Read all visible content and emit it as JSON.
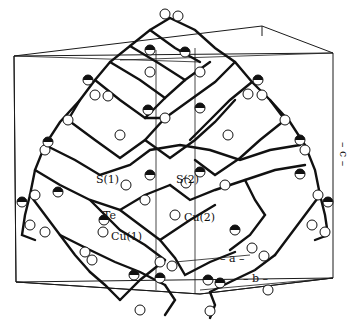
{
  "figure": {
    "atom_labels": [
      {
        "id": "s1",
        "text": "S(1)",
        "x": 96,
        "y": 167
      },
      {
        "id": "s2",
        "text": "S(2)",
        "x": 177,
        "y": 167
      },
      {
        "id": "te",
        "text": "Te",
        "x": 104,
        "y": 208
      },
      {
        "id": "cu1",
        "text": "Cu(1)",
        "x": 112,
        "y": 228
      },
      {
        "id": "cu2",
        "text": "Cu(2)",
        "x": 184,
        "y": 210
      }
    ],
    "axis_labels": {
      "a": "– a –",
      "b": "– b –",
      "c": "– c –"
    },
    "colors": {
      "line": "#111111",
      "background": "#ffffff",
      "atom_fill": "#ffffff"
    }
  }
}
